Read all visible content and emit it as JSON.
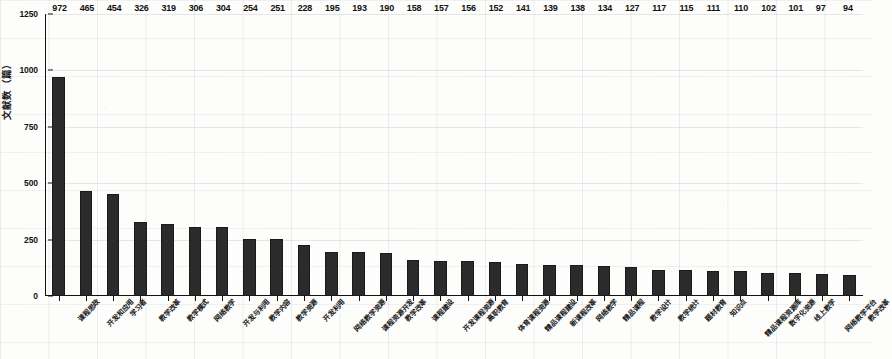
{
  "chart_data": {
    "type": "bar",
    "title": "",
    "xlabel": "",
    "ylabel": "文献数（篇）",
    "ylim": [
      0,
      1250
    ],
    "ytick_values": [
      0,
      250,
      500,
      750,
      1000,
      1250
    ],
    "ytick_labels": [
      "0",
      "250",
      "500",
      "750",
      "1000",
      "1250"
    ],
    "grid": true,
    "legend": null,
    "bar_color": "#2b2b2b",
    "categories": [
      "课程思政",
      "开发和应用",
      "学习者",
      "教学改革",
      "教学模式",
      "网络教学",
      "开发与利用",
      "教学内容",
      "教学资源",
      "开发利用",
      "网络教学资源",
      "课程资源开发",
      "教学改革",
      "课程建设",
      "开发课程资源",
      "高职教育",
      "体育课程资源",
      "精品课程建设",
      "新课程改革",
      "网络教学",
      "精品课程",
      "教学设计",
      "教学统计",
      "题材教育",
      "知识点",
      "精品课程资源库",
      "数字化资源",
      "线上教学",
      "网络教学平台",
      "教学改革"
    ],
    "values": [
      972,
      465,
      454,
      326,
      319,
      306,
      304,
      254,
      251,
      228,
      195,
      193,
      190,
      158,
      157,
      156,
      152,
      141,
      139,
      138,
      134,
      127,
      117,
      115,
      111,
      110,
      102,
      101,
      97,
      94
    ],
    "data_labels": [
      "972",
      "465",
      "454",
      "326",
      "319",
      "306",
      "304",
      "254",
      "251",
      "228",
      "195",
      "193",
      "190",
      "158",
      "157",
      "156",
      "152",
      "141",
      "139",
      "138",
      "134",
      "127",
      "117",
      "115",
      "111",
      "110",
      "102",
      "101",
      "97",
      "94"
    ],
    "bar_count": 30
  }
}
